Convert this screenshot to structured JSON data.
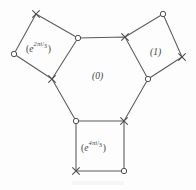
{
  "figure": {
    "kind": "geometric-diagram",
    "stroke_color": "#595a5c",
    "background_color": "#fdfdfd",
    "label_color": "#404144",
    "regions": [
      {
        "id": "topleft-square",
        "shape": "square",
        "label_text": "(e^{2πi/3})",
        "label_base": "e",
        "label_num": "2πi",
        "label_den": "3",
        "open_paren": "(",
        "close_paren": ")"
      },
      {
        "id": "right-square",
        "shape": "square",
        "label_text": "(1)",
        "label_plain": "(1)"
      },
      {
        "id": "center-hexagon",
        "shape": "hexagon",
        "label_text": "(0)",
        "label_plain": "(0)"
      },
      {
        "id": "bottom-square",
        "shape": "square",
        "label_text": "(e^{4πi/3})",
        "label_base": "e",
        "label_num": "4πi",
        "label_den": "3",
        "open_paren": "(",
        "close_paren": ")"
      }
    ],
    "vertex_markers": {
      "cross_symbol": "×",
      "circle_symbol": "○"
    },
    "hexagon_vertices": [
      {
        "x": 78,
        "y": 38,
        "marker": "circle"
      },
      {
        "x": 125,
        "y": 37,
        "marker": "cross"
      },
      {
        "x": 148,
        "y": 79,
        "marker": "circle"
      },
      {
        "x": 124,
        "y": 121,
        "marker": "cross"
      },
      {
        "x": 76,
        "y": 121,
        "marker": "circle"
      },
      {
        "x": 52,
        "y": 79,
        "marker": "cross"
      }
    ],
    "topleft_square_vertices": [
      {
        "x": 78,
        "y": 38,
        "marker": "circle"
      },
      {
        "x": 36,
        "y": 14,
        "marker": "cross"
      },
      {
        "x": 14,
        "y": 54,
        "marker": "circle"
      },
      {
        "x": 52,
        "y": 79,
        "marker": "cross"
      }
    ],
    "right_square_vertices": [
      {
        "x": 125,
        "y": 37,
        "marker": "cross"
      },
      {
        "x": 163,
        "y": 14,
        "marker": "circle"
      },
      {
        "x": 182,
        "y": 57,
        "marker": "cross"
      },
      {
        "x": 148,
        "y": 79,
        "marker": "circle"
      }
    ],
    "bottom_square_vertices": [
      {
        "x": 76,
        "y": 121,
        "marker": "circle"
      },
      {
        "x": 124,
        "y": 121,
        "marker": "cross"
      },
      {
        "x": 124,
        "y": 171,
        "marker": "circle"
      },
      {
        "x": 76,
        "y": 171,
        "marker": "cross"
      }
    ]
  }
}
